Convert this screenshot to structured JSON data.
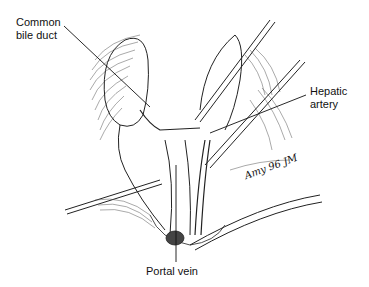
{
  "figure": {
    "labels": {
      "common_bile_duct": [
        "Common",
        "bile duct"
      ],
      "hepatic_artery": [
        "Hepatic",
        "artery"
      ],
      "portal_vein": "Portal vein"
    },
    "signature": "Amy 96 JM"
  }
}
